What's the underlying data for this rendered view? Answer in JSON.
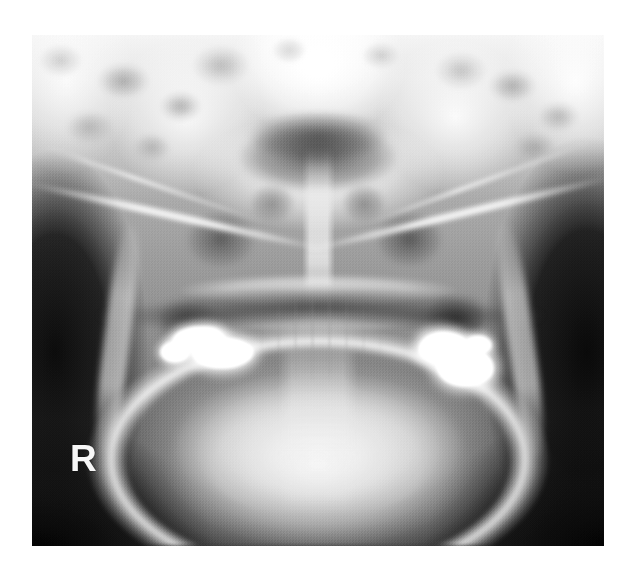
{
  "image": {
    "kind": "radiograph",
    "modality": "dental-panoramic-radiograph",
    "region": "maxillofacial / jaws",
    "background_color": "#ffffff",
    "plate": {
      "left": 32,
      "top": 35,
      "width": 572,
      "height": 511,
      "border_color": "#1a1a1a"
    }
  },
  "annotations": {
    "side_marker": {
      "label": "R",
      "meaning": "right-side-orientation-marker",
      "color": "#f4f4f4"
    }
  },
  "anatomy": {
    "labels": [
      "cranial base",
      "temporal bone",
      "nasal airway",
      "nasal septum",
      "maxillary antrum left",
      "maxillary antrum right",
      "zygomatic arch left",
      "zygomatic arch right",
      "hard palate",
      "oral airway",
      "mandibular ramus left",
      "mandibular ramus right",
      "mandible body",
      "cervical spine"
    ]
  },
  "findings": {
    "restorations": [
      "radiopaque dental restoration, left posterior",
      "radiopaque dental restoration, right posterior"
    ]
  },
  "palette": {
    "film_highlight": "#ffffff",
    "film_midtone": "#9a9a9a",
    "film_shadow": "#1a1a1a",
    "page_background": "#ffffff",
    "marker_text": "#f4f4f4"
  }
}
